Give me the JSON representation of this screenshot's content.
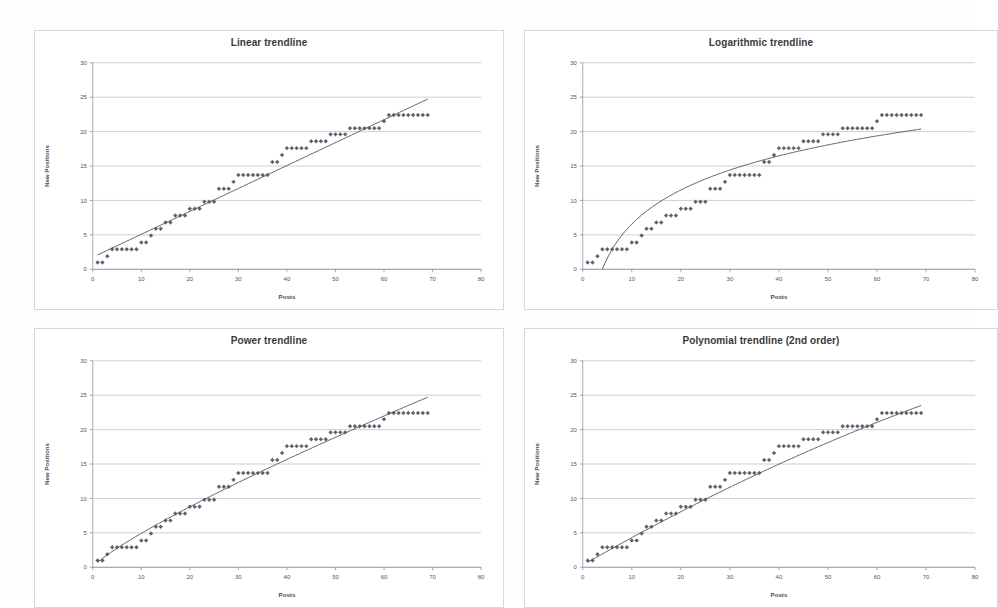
{
  "page": {
    "background_color": "#fdfdfc",
    "panel_border_color": "#d8d8d8",
    "marker_color": "#5a5f6e",
    "trendline_color": "#4d4d4d",
    "gridline_color": "#9aa7bf"
  },
  "panels": [
    {
      "id": "linear",
      "title": "Linear trendline"
    },
    {
      "id": "logarithmic",
      "title": "Logarithmic trendline"
    },
    {
      "id": "power",
      "title": "Power trendline"
    },
    {
      "id": "polynomial",
      "title": "Polynomial trendline (2nd order)"
    }
  ],
  "axes": {
    "xlabel": "Posts",
    "ylabel": "New Positions",
    "xticks": [
      "0",
      "10",
      "20",
      "30",
      "40",
      "50",
      "60",
      "70",
      "80"
    ],
    "yticks": [
      "0",
      "5",
      "10",
      "15",
      "20",
      "25",
      "30"
    ],
    "xlim": [
      0,
      80
    ],
    "ylim": [
      0,
      30
    ]
  },
  "chart_data": [
    {
      "type": "scatter",
      "title": "Linear trendline",
      "xlabel": "Posts",
      "ylabel": "New Positions",
      "xlim": [
        0,
        80
      ],
      "ylim": [
        0,
        30
      ],
      "grid": true,
      "legend": "none",
      "series": [
        {
          "name": "New Positions",
          "marker": "diamond",
          "x": [
            1,
            2,
            3,
            4,
            5,
            6,
            7,
            8,
            9,
            10,
            11,
            12,
            13,
            14,
            15,
            16,
            17,
            18,
            19,
            20,
            21,
            22,
            23,
            24,
            25,
            26,
            27,
            28,
            29,
            30,
            31,
            32,
            33,
            34,
            35,
            36,
            37,
            38,
            39,
            40,
            41,
            42,
            43,
            44,
            45,
            46,
            47,
            48,
            49,
            50,
            51,
            52,
            53,
            54,
            55,
            56,
            57,
            58,
            59,
            60,
            61,
            62,
            63,
            64,
            65,
            66,
            67,
            68,
            69
          ],
          "y": [
            1.0,
            1.0,
            1.9,
            2.9,
            2.9,
            2.9,
            2.9,
            2.9,
            2.9,
            3.9,
            3.9,
            4.9,
            5.9,
            5.9,
            6.8,
            6.8,
            7.8,
            7.8,
            7.8,
            8.8,
            8.8,
            8.8,
            9.8,
            9.8,
            9.8,
            11.7,
            11.7,
            11.7,
            12.7,
            13.7,
            13.7,
            13.7,
            13.7,
            13.7,
            13.7,
            13.7,
            15.6,
            15.6,
            16.6,
            17.6,
            17.6,
            17.6,
            17.6,
            17.6,
            18.6,
            18.6,
            18.6,
            18.6,
            19.6,
            19.6,
            19.6,
            19.6,
            20.5,
            20.5,
            20.5,
            20.5,
            20.5,
            20.5,
            20.5,
            21.5,
            22.4,
            22.4,
            22.4,
            22.4,
            22.4,
            22.4,
            22.4,
            22.4,
            22.4
          ]
        }
      ],
      "trendline": {
        "kind": "linear",
        "equation_form": "y = a*x + b",
        "a": 0.333,
        "b": 1.75,
        "x_from": 1,
        "x_to": 69
      }
    },
    {
      "type": "scatter",
      "title": "Logarithmic trendline",
      "xlabel": "Posts",
      "ylabel": "New Positions",
      "xlim": [
        0,
        80
      ],
      "ylim": [
        0,
        30
      ],
      "grid": true,
      "legend": "none",
      "series": [
        {
          "name": "New Positions",
          "marker": "diamond",
          "x": [
            1,
            2,
            3,
            4,
            5,
            6,
            7,
            8,
            9,
            10,
            11,
            12,
            13,
            14,
            15,
            16,
            17,
            18,
            19,
            20,
            21,
            22,
            23,
            24,
            25,
            26,
            27,
            28,
            29,
            30,
            31,
            32,
            33,
            34,
            35,
            36,
            37,
            38,
            39,
            40,
            41,
            42,
            43,
            44,
            45,
            46,
            47,
            48,
            49,
            50,
            51,
            52,
            53,
            54,
            55,
            56,
            57,
            58,
            59,
            60,
            61,
            62,
            63,
            64,
            65,
            66,
            67,
            68,
            69
          ],
          "y": [
            1.0,
            1.0,
            1.9,
            2.9,
            2.9,
            2.9,
            2.9,
            2.9,
            2.9,
            3.9,
            3.9,
            4.9,
            5.9,
            5.9,
            6.8,
            6.8,
            7.8,
            7.8,
            7.8,
            8.8,
            8.8,
            8.8,
            9.8,
            9.8,
            9.8,
            11.7,
            11.7,
            11.7,
            12.7,
            13.7,
            13.7,
            13.7,
            13.7,
            13.7,
            13.7,
            13.7,
            15.6,
            15.6,
            16.6,
            17.6,
            17.6,
            17.6,
            17.6,
            17.6,
            18.6,
            18.6,
            18.6,
            18.6,
            19.6,
            19.6,
            19.6,
            19.6,
            20.5,
            20.5,
            20.5,
            20.5,
            20.5,
            20.5,
            20.5,
            21.5,
            22.4,
            22.4,
            22.4,
            22.4,
            22.4,
            22.4,
            22.4,
            22.4,
            22.4
          ]
        }
      ],
      "trendline": {
        "kind": "logarithmic",
        "equation_form": "y = a*ln(x) + b",
        "a": 7.15,
        "b": -9.9,
        "x_from": 4,
        "x_to": 69
      }
    },
    {
      "type": "scatter",
      "title": "Power trendline",
      "xlabel": "Posts",
      "ylabel": "New Positions",
      "xlim": [
        0,
        80
      ],
      "ylim": [
        0,
        30
      ],
      "grid": true,
      "legend": "none",
      "series": [
        {
          "name": "New Positions",
          "marker": "diamond",
          "x": [
            1,
            2,
            3,
            4,
            5,
            6,
            7,
            8,
            9,
            10,
            11,
            12,
            13,
            14,
            15,
            16,
            17,
            18,
            19,
            20,
            21,
            22,
            23,
            24,
            25,
            26,
            27,
            28,
            29,
            30,
            31,
            32,
            33,
            34,
            35,
            36,
            37,
            38,
            39,
            40,
            41,
            42,
            43,
            44,
            45,
            46,
            47,
            48,
            49,
            50,
            51,
            52,
            53,
            54,
            55,
            56,
            57,
            58,
            59,
            60,
            61,
            62,
            63,
            64,
            65,
            66,
            67,
            68,
            69
          ],
          "y": [
            1.0,
            1.0,
            1.9,
            2.9,
            2.9,
            2.9,
            2.9,
            2.9,
            2.9,
            3.9,
            3.9,
            4.9,
            5.9,
            5.9,
            6.8,
            6.8,
            7.8,
            7.8,
            7.8,
            8.8,
            8.8,
            8.8,
            9.8,
            9.8,
            9.8,
            11.7,
            11.7,
            11.7,
            12.7,
            13.7,
            13.7,
            13.7,
            13.7,
            13.7,
            13.7,
            13.7,
            15.6,
            15.6,
            16.6,
            17.6,
            17.6,
            17.6,
            17.6,
            17.6,
            18.6,
            18.6,
            18.6,
            18.6,
            19.6,
            19.6,
            19.6,
            19.6,
            20.5,
            20.5,
            20.5,
            20.5,
            20.5,
            20.5,
            20.5,
            21.5,
            22.4,
            22.4,
            22.4,
            22.4,
            22.4,
            22.4,
            22.4,
            22.4,
            22.4
          ]
        }
      ],
      "trendline": {
        "kind": "power",
        "equation_form": "y = a*x^b",
        "a": 0.72,
        "b": 0.835,
        "x_from": 1,
        "x_to": 69
      }
    },
    {
      "type": "scatter",
      "title": "Polynomial trendline (2nd order)",
      "xlabel": "Posts",
      "ylabel": "New Positions",
      "xlim": [
        0,
        80
      ],
      "ylim": [
        0,
        30
      ],
      "grid": true,
      "legend": "none",
      "series": [
        {
          "name": "New Positions",
          "marker": "diamond",
          "x": [
            1,
            2,
            3,
            4,
            5,
            6,
            7,
            8,
            9,
            10,
            11,
            12,
            13,
            14,
            15,
            16,
            17,
            18,
            19,
            20,
            21,
            22,
            23,
            24,
            25,
            26,
            27,
            28,
            29,
            30,
            31,
            32,
            33,
            34,
            35,
            36,
            37,
            38,
            39,
            40,
            41,
            42,
            43,
            44,
            45,
            46,
            47,
            48,
            49,
            50,
            51,
            52,
            53,
            54,
            55,
            56,
            57,
            58,
            59,
            60,
            61,
            62,
            63,
            64,
            65,
            66,
            67,
            68,
            69
          ],
          "y": [
            1.0,
            1.0,
            1.9,
            2.9,
            2.9,
            2.9,
            2.9,
            2.9,
            2.9,
            3.9,
            3.9,
            4.9,
            5.9,
            5.9,
            6.8,
            6.8,
            7.8,
            7.8,
            7.8,
            8.8,
            8.8,
            8.8,
            9.8,
            9.8,
            9.8,
            11.7,
            11.7,
            11.7,
            12.7,
            13.7,
            13.7,
            13.7,
            13.7,
            13.7,
            13.7,
            13.7,
            15.6,
            15.6,
            16.6,
            17.6,
            17.6,
            17.6,
            17.6,
            17.6,
            18.6,
            18.6,
            18.6,
            18.6,
            19.6,
            19.6,
            19.6,
            19.6,
            20.5,
            20.5,
            20.5,
            20.5,
            20.5,
            20.5,
            20.5,
            21.5,
            22.4,
            22.4,
            22.4,
            22.4,
            22.4,
            22.4,
            22.4,
            22.4,
            22.4
          ]
        }
      ],
      "trendline": {
        "kind": "polynomial2",
        "equation_form": "y = a*x^2 + b*x + c",
        "a": -0.00105,
        "b": 0.4085,
        "c": 0.32,
        "x_from": 1,
        "x_to": 69
      }
    }
  ]
}
